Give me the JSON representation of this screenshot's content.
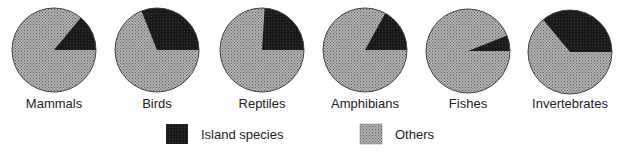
{
  "chart_data": {
    "type": "pie",
    "title": "",
    "series_labels": [
      "Island species",
      "Others"
    ],
    "colors": {
      "Island species": "#1e1e1e",
      "Others": "#9a9a9a"
    },
    "pies": [
      {
        "label": "Mammals",
        "island_species": 14,
        "others": 86
      },
      {
        "label": "Birds",
        "island_species": 31,
        "others": 69
      },
      {
        "label": "Reptiles",
        "island_species": 24,
        "others": 76
      },
      {
        "label": "Amphibians",
        "island_species": 17,
        "others": 83
      },
      {
        "label": "Fishes",
        "island_species": 6,
        "others": 94
      },
      {
        "label": "Invertebrates",
        "island_species": 36,
        "others": 64
      }
    ],
    "legend": {
      "position": "bottom",
      "items": [
        "Island species",
        "Others"
      ]
    }
  },
  "legend": {
    "island": "Island species",
    "others": "Others"
  },
  "labels": [
    "Mammals",
    "Birds",
    "Reptiles",
    "Amphibians",
    "Fishes",
    "Invertebrates"
  ]
}
